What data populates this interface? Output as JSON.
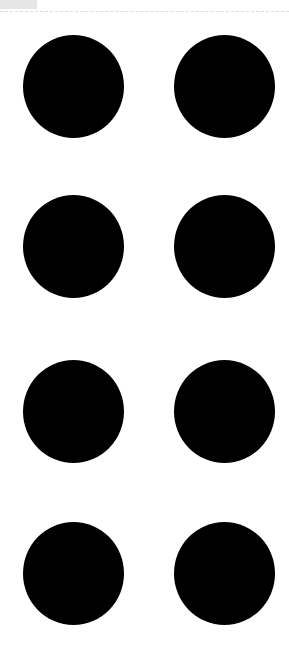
{
  "page": {
    "background": "#ffffff",
    "top_tab": {
      "color": "#e6e6e6"
    },
    "divider": {
      "style": "dashed",
      "color": "#dcdcdc"
    }
  },
  "dots": {
    "color": "#000000",
    "rows": 4,
    "columns": 2,
    "count": 8,
    "items": [
      {
        "row": 1,
        "col": 1,
        "x": 23,
        "y": 35
      },
      {
        "row": 1,
        "col": 2,
        "x": 174,
        "y": 35
      },
      {
        "row": 2,
        "col": 1,
        "x": 23,
        "y": 195
      },
      {
        "row": 2,
        "col": 2,
        "x": 174,
        "y": 195
      },
      {
        "row": 3,
        "col": 1,
        "x": 23,
        "y": 360
      },
      {
        "row": 3,
        "col": 2,
        "x": 174,
        "y": 360
      },
      {
        "row": 4,
        "col": 1,
        "x": 23,
        "y": 522
      },
      {
        "row": 4,
        "col": 2,
        "x": 174,
        "y": 522
      }
    ]
  }
}
